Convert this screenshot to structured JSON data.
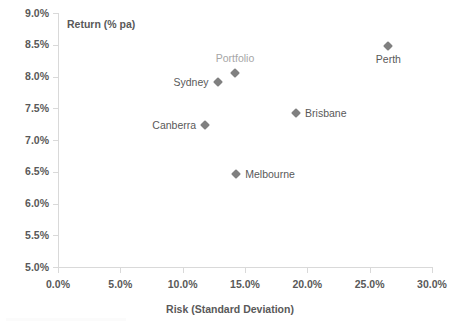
{
  "chart_data": {
    "type": "scatter",
    "title": "",
    "xlabel": "Risk (Standard Deviation)",
    "ylabel": "Return (% pa)",
    "xlim": [
      0.0,
      30.0
    ],
    "ylim": [
      5.0,
      9.0
    ],
    "xticks": [
      "0.0%",
      "5.0%",
      "10.0%",
      "15.0%",
      "20.0%",
      "25.0%",
      "30.0%"
    ],
    "xtick_values": [
      0.0,
      5.0,
      10.0,
      15.0,
      20.0,
      25.0,
      30.0
    ],
    "yticks": [
      "5.0%",
      "5.5%",
      "6.0%",
      "6.5%",
      "7.0%",
      "7.5%",
      "8.0%",
      "8.5%",
      "9.0%"
    ],
    "ytick_values": [
      5.0,
      5.5,
      6.0,
      6.5,
      7.0,
      7.5,
      8.0,
      8.5,
      9.0
    ],
    "grid": false,
    "legend": "none",
    "marker": "diamond",
    "marker_color": "#808080",
    "points": [
      {
        "label": "Canberra",
        "x": 11.8,
        "y": 7.24,
        "label_pos": "left",
        "label_color": "#595959"
      },
      {
        "label": "Sydney",
        "x": 12.8,
        "y": 7.92,
        "label_pos": "left",
        "label_color": "#595959"
      },
      {
        "label": "Portfolio",
        "x": 14.2,
        "y": 8.05,
        "label_pos": "top",
        "label_color": "#a6a6a6"
      },
      {
        "label": "Melbourne",
        "x": 14.3,
        "y": 6.46,
        "label_pos": "right",
        "label_color": "#595959"
      },
      {
        "label": "Brisbane",
        "x": 19.1,
        "y": 7.42,
        "label_pos": "right",
        "label_color": "#595959"
      },
      {
        "label": "Perth",
        "x": 26.5,
        "y": 8.48,
        "label_pos": "bottom",
        "label_color": "#595959"
      }
    ]
  },
  "axis": {
    "y_title": "Return (% pa)",
    "x_title": "Risk (Standard Deviation)"
  },
  "colors": {
    "axis_line": "#d9d9d9",
    "text": "#595959",
    "muted_text": "#a6a6a6",
    "marker": "#808080",
    "background": "#ffffff"
  }
}
